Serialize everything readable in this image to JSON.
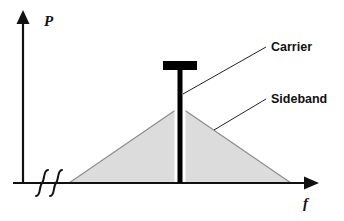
{
  "figure": {
    "title": "",
    "background_color": "#ffffff",
    "width": 344,
    "height": 221
  },
  "axes": {
    "y": {
      "label": "P",
      "label_x": 44,
      "label_y": 26,
      "line_x": 23,
      "line_top": 18,
      "line_bottom": 184,
      "arrow": "up-arrow-icon",
      "color": "#111111"
    },
    "x": {
      "label": "f",
      "label_x": 303,
      "label_y": 208,
      "line_y": 183,
      "line_left": 13,
      "line_right": 306,
      "arrow": "right-arrow-icon",
      "color": "#111111"
    },
    "break": {
      "symbol": "axis-break-squiggles",
      "count": 2,
      "x_positions": [
        40,
        54
      ],
      "y_center": 183,
      "color": "#111111"
    }
  },
  "plot": {
    "sideband": {
      "name": "Sideband",
      "shape": "triangle",
      "left_base_x": 69,
      "right_base_x": 291,
      "base_y": 183,
      "peak_x": 180,
      "peak_y": 107,
      "fill_color": "#dcdcdc",
      "stroke_color": "#808080"
    },
    "carrier": {
      "name": "Carrier",
      "shape": "capped-vertical-bar",
      "x": 180,
      "top_y": 70,
      "bottom_y": 183,
      "bar_width": 5,
      "cap_left_x": 163,
      "cap_right_x": 197,
      "cap_top_y": 61,
      "cap_height": 9,
      "gap_width": 4,
      "color": "#000000"
    }
  },
  "callouts": [
    {
      "label": "Carrier",
      "text_x": 271,
      "text_y": 51,
      "leader_from_x": 183,
      "leader_from_y": 94,
      "leader_to_x": 266,
      "leader_to_y": 47,
      "color": "#111111"
    },
    {
      "label": "Sideband",
      "text_x": 271,
      "text_y": 103,
      "leader_from_x": 214,
      "leader_from_y": 130,
      "leader_to_x": 266,
      "leader_to_y": 99,
      "color": "#111111"
    }
  ]
}
